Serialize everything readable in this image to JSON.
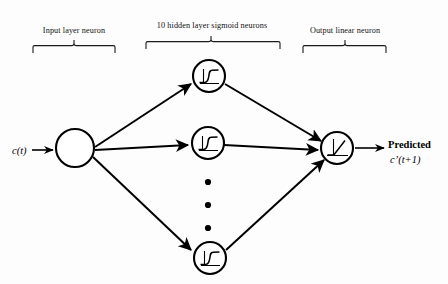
{
  "diagram": {
    "background_color": "#fdfdfd",
    "stroke_color": "#000000",
    "labels": {
      "input_group": "Input layer neuron",
      "hidden_group": "10 hidden layer sigmoid neurons",
      "output_group": "Output linear neuron",
      "input_signal": "c(t)",
      "output_caption": "Predicted",
      "output_signal": "c’(t+1)"
    },
    "layers": [
      {
        "id": "input",
        "name": "Input layer neuron",
        "neuron_count": 1,
        "activation": "none",
        "neurons": [
          {
            "id": "input-1",
            "cx": 75,
            "cy": 148,
            "r": 19,
            "glyph": "empty"
          }
        ]
      },
      {
        "id": "hidden",
        "name": "10 hidden layer sigmoid neurons",
        "neuron_count": 10,
        "visible_neuron_count": 3,
        "activation": "sigmoid",
        "neurons": [
          {
            "id": "hidden-1",
            "cx": 209,
            "cy": 76,
            "r": 16,
            "glyph": "sigmoid-icon"
          },
          {
            "id": "hidden-2",
            "cx": 208,
            "cy": 143,
            "r": 16,
            "glyph": "sigmoid-icon"
          },
          {
            "id": "hidden-10",
            "cx": 210,
            "cy": 258,
            "r": 16,
            "glyph": "sigmoid-icon"
          }
        ],
        "ellipsis": {
          "x": 208,
          "dot_radius": 3.1,
          "ys": [
            182,
            205,
            228
          ]
        }
      },
      {
        "id": "output",
        "name": "Output linear neuron",
        "neuron_count": 1,
        "activation": "linear",
        "neurons": [
          {
            "id": "output-1",
            "cx": 337,
            "cy": 148,
            "r": 16,
            "glyph": "linear-icon"
          }
        ]
      }
    ],
    "connections": [
      {
        "from": "input-1",
        "to": "hidden-1"
      },
      {
        "from": "input-1",
        "to": "hidden-2"
      },
      {
        "from": "input-1",
        "to": "hidden-10"
      },
      {
        "from": "hidden-1",
        "to": "output-1"
      },
      {
        "from": "hidden-2",
        "to": "output-1"
      },
      {
        "from": "hidden-10",
        "to": "output-1"
      }
    ],
    "braces": [
      {
        "id": "brace-input",
        "label": "Input layer neuron",
        "x_start": 33,
        "x_end": 115,
        "y": 46,
        "tick_x": 74,
        "label_y": 30
      },
      {
        "id": "brace-hidden",
        "label": "10 hidden layer sigmoid neurons",
        "x_start": 146,
        "x_end": 280,
        "y": 42,
        "tick_x": 211,
        "label_y": 24
      },
      {
        "id": "brace-output",
        "label": "Output linear neuron",
        "x_start": 303,
        "x_end": 386,
        "y": 46,
        "tick_x": 345,
        "label_y": 30
      }
    ]
  }
}
